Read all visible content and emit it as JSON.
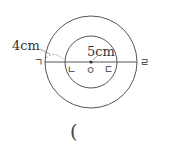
{
  "diagram": {
    "outer_circle": {
      "cx": 91,
      "cy": 62,
      "r": 46
    },
    "inner_circle": {
      "cx": 91,
      "cy": 62,
      "r": 26
    },
    "line": {
      "x1": 45,
      "x2": 137,
      "y": 62
    },
    "labels": {
      "g": "ㄱ",
      "n": "ㄴ",
      "o": "ㅇ",
      "d": "ㄷ",
      "r": "ㄹ",
      "len_outer_gap": "4cm",
      "len_inner_radius": "5cm"
    },
    "answer_paren": "("
  },
  "colors": {
    "stroke": "#555555",
    "text": "#333333"
  }
}
